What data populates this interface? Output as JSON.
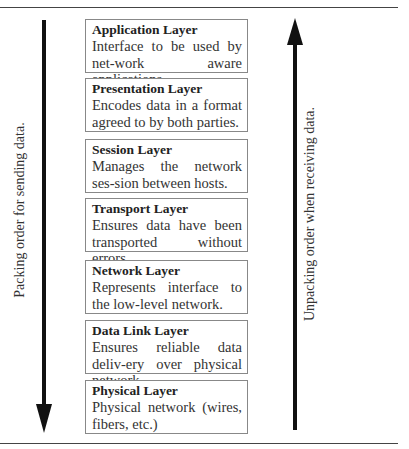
{
  "diagram": {
    "layers": [
      {
        "title": "Application Layer",
        "description": "Interface to be used by net-work aware applications."
      },
      {
        "title": "Presentation Layer",
        "description": "Encodes data in a format agreed to by both parties."
      },
      {
        "title": "Session Layer",
        "description": "Manages the network ses-sion between hosts."
      },
      {
        "title": "Transport Layer",
        "description": "Ensures data have been transported without errors."
      },
      {
        "title": "Network Layer",
        "description": "Represents interface to the low-level network."
      },
      {
        "title": "Data Link Layer",
        "description": "Ensures reliable data deliv-ery over physical network."
      },
      {
        "title": "Physical Layer",
        "description": "Physical network (wires, fibers, etc.)"
      }
    ],
    "left_arrow": {
      "label": "Packing order for sending data.",
      "direction": "down"
    },
    "right_arrow": {
      "label": "Unpacking order when receiving data.",
      "direction": "up"
    }
  }
}
